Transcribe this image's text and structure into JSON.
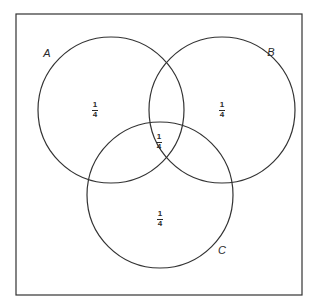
{
  "diagram": {
    "type": "venn",
    "frame": {
      "x": 15,
      "y": 14,
      "width": 287,
      "height": 281,
      "stroke": "#333333"
    },
    "circles": [
      {
        "id": "A",
        "label": "A",
        "cx": 111,
        "cy": 110,
        "r": 73,
        "label_pos": {
          "x": 47,
          "y": 53
        }
      },
      {
        "id": "B",
        "label": "B",
        "cx": 222,
        "cy": 110,
        "r": 73,
        "label_pos": {
          "x": 271,
          "y": 52
        }
      },
      {
        "id": "C",
        "label": "C",
        "cx": 160,
        "cy": 196,
        "r": 73,
        "label_pos": {
          "x": 222,
          "y": 250
        }
      }
    ],
    "regions": [
      {
        "name": "A only",
        "num": "1",
        "den": "4",
        "x": 95,
        "y": 110
      },
      {
        "name": "B only",
        "num": "1",
        "den": "4",
        "x": 222,
        "y": 110
      },
      {
        "name": "A∩B∩C",
        "num": "1",
        "den": "4",
        "x": 159,
        "y": 142
      },
      {
        "name": "C only",
        "num": "1",
        "den": "4",
        "x": 160,
        "y": 219
      }
    ],
    "stroke_color": "#333333"
  }
}
